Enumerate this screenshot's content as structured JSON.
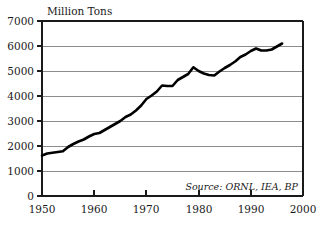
{
  "chart_data": {
    "type": "line",
    "title": "",
    "ylabel": "Million Tons",
    "xlabel": "",
    "xlim": [
      1950,
      2000
    ],
    "ylim": [
      0,
      7000
    ],
    "grid": true,
    "legend": false,
    "annotation": "Source: ORNL, IEA, BP",
    "x_ticks": [
      "1950",
      "1960",
      "1970",
      "1980",
      "1990",
      "2000"
    ],
    "x_tick_values": [
      1950,
      1960,
      1970,
      1980,
      1990,
      2000
    ],
    "y_ticks": [
      "0",
      "1000",
      "2000",
      "3000",
      "4000",
      "5000",
      "6000",
      "7000"
    ],
    "y_tick_values": [
      0,
      1000,
      2000,
      3000,
      4000,
      5000,
      6000,
      7000
    ],
    "series": [
      {
        "name": "Million Tons",
        "x": [
          1950,
          1951,
          1952,
          1953,
          1954,
          1955,
          1956,
          1957,
          1958,
          1959,
          1960,
          1961,
          1962,
          1963,
          1964,
          1965,
          1966,
          1967,
          1968,
          1969,
          1970,
          1971,
          1972,
          1973,
          1974,
          1975,
          1976,
          1977,
          1978,
          1979,
          1980,
          1981,
          1982,
          1983,
          1984,
          1985,
          1986,
          1987,
          1988,
          1989,
          1990,
          1991,
          1992,
          1993,
          1994,
          1995,
          1996
        ],
        "values": [
          1620,
          1700,
          1730,
          1760,
          1790,
          1960,
          2080,
          2180,
          2260,
          2380,
          2480,
          2520,
          2640,
          2760,
          2880,
          3000,
          3160,
          3260,
          3420,
          3620,
          3880,
          4020,
          4180,
          4420,
          4400,
          4400,
          4640,
          4760,
          4880,
          5150,
          5000,
          4900,
          4840,
          4820,
          4980,
          5120,
          5240,
          5380,
          5560,
          5660,
          5800,
          5900,
          5820,
          5820,
          5860,
          5980,
          6100
        ]
      }
    ]
  },
  "axis": {
    "y_title": "Million Tons"
  },
  "source": {
    "text": "Source: ORNL, IEA, BP"
  }
}
